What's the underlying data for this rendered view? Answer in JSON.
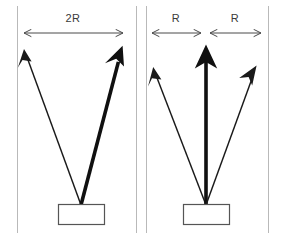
{
  "figure": {
    "background_color": "#ffffff",
    "frame_color": "#b9b9b9",
    "ray_color": "#1a1a1a",
    "dimension_color": "#4a4a4a",
    "box_stroke_color": "#555555",
    "box_fill_color": "#ffffff"
  },
  "panels": [
    {
      "id": "left",
      "name": "single-wide-beam-panel",
      "dimension_labels": [
        {
          "text": "2R",
          "x": 73,
          "y": 22
        }
      ],
      "dimension_lines": [
        {
          "name": "span-2r",
          "x1": 22,
          "x2": 125,
          "y": 33
        }
      ],
      "source_box": {
        "x": 58,
        "y": 204,
        "width": 46,
        "height": 20
      },
      "rays": [
        {
          "name": "left-ray",
          "weight": "thin",
          "x1": 81,
          "y1": 205,
          "x2": 25,
          "y2": 52
        },
        {
          "name": "right-ray",
          "weight": "thick",
          "x1": 81,
          "y1": 205,
          "x2": 122,
          "y2": 48
        }
      ]
    },
    {
      "id": "right",
      "name": "split-beam-panel",
      "dimension_labels": [
        {
          "text": "R",
          "x": 176,
          "y": 22
        },
        {
          "text": "R",
          "x": 235,
          "y": 22
        }
      ],
      "dimension_lines": [
        {
          "name": "span-r-left",
          "x1": 150,
          "x2": 203,
          "y": 33
        },
        {
          "name": "span-r-right",
          "x1": 208,
          "x2": 263,
          "y": 33
        }
      ],
      "source_box": {
        "x": 183,
        "y": 204,
        "width": 46,
        "height": 20
      },
      "rays": [
        {
          "name": "left-ray",
          "weight": "thin",
          "x1": 206,
          "y1": 205,
          "x2": 154,
          "y2": 70
        },
        {
          "name": "center-ray",
          "weight": "thick",
          "x1": 206,
          "y1": 205,
          "x2": 206,
          "y2": 46
        },
        {
          "name": "right-ray",
          "weight": "thin",
          "x1": 206,
          "y1": 205,
          "x2": 256,
          "y2": 68
        }
      ]
    }
  ],
  "frame": {
    "name": "panel-dividers",
    "vertical_lines": [
      {
        "name": "outer-left-border",
        "x": 17,
        "y1": 6,
        "y2": 233
      },
      {
        "name": "divider-left",
        "x": 136,
        "y1": 6,
        "y2": 233
      },
      {
        "name": "divider-right",
        "x": 146,
        "y1": 6,
        "y2": 233
      },
      {
        "name": "outer-right-border",
        "x": 268,
        "y1": 6,
        "y2": 233
      }
    ]
  }
}
